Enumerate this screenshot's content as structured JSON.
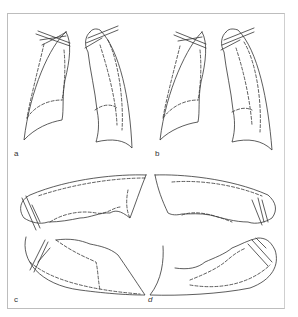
{
  "figure": {
    "type": "line-diagram",
    "panels": [
      {
        "id": "a",
        "label": "a",
        "view": "frontal pair of lungs"
      },
      {
        "id": "b",
        "label": "b",
        "view": "frontal pair of lungs"
      },
      {
        "id": "c",
        "label": "c",
        "view": "lateral, left-facing upper and lower outlines"
      },
      {
        "id": "d",
        "label": "d",
        "view": "lateral, right-facing upper and lower outlines"
      }
    ],
    "colors": {
      "line": "#333333",
      "frame": "#bdbdbd",
      "background": "#ffffff"
    }
  }
}
